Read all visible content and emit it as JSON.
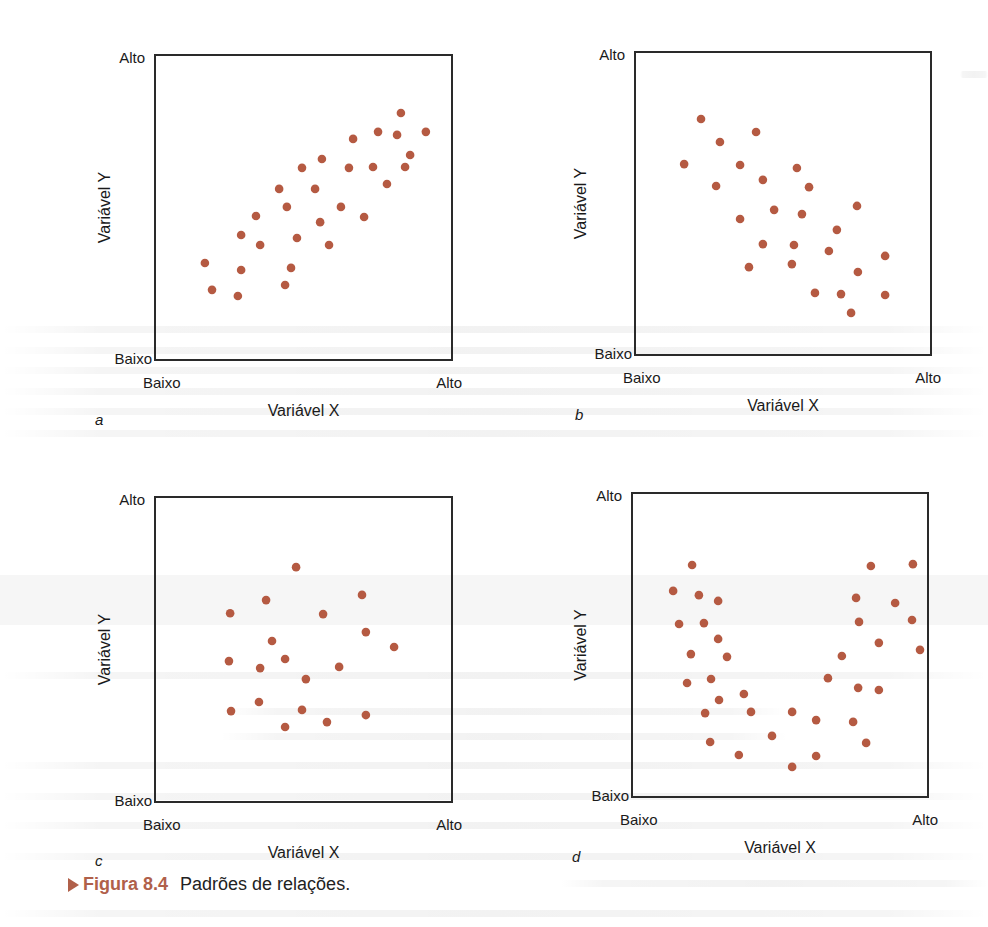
{
  "figure": {
    "caption_label": "Figura 8.4",
    "caption_text": "Padrões de relações.",
    "dot_color": "#b55a42",
    "caption_color": "#b0604a"
  },
  "chart_data": [
    {
      "type": "scatter",
      "panel": "a",
      "title": "",
      "xlabel": "Variável X",
      "ylabel": "Variável Y",
      "x_ticks": [
        "Baixo",
        "Alto"
      ],
      "y_ticks": [
        "Baixo",
        "Alto"
      ],
      "xlim": [
        0,
        100
      ],
      "ylim": [
        0,
        100
      ],
      "grid": false,
      "relationship": "positive linear",
      "points": [
        [
          16.8,
          31.8
        ],
        [
          19.2,
          23.0
        ],
        [
          29.0,
          41.0
        ],
        [
          29.0,
          29.5
        ],
        [
          27.9,
          21.0
        ],
        [
          34.0,
          47.2
        ],
        [
          35.4,
          37.7
        ],
        [
          41.8,
          56.1
        ],
        [
          44.4,
          50.2
        ],
        [
          45.8,
          30.2
        ],
        [
          43.8,
          24.6
        ],
        [
          47.8,
          40.0
        ],
        [
          49.5,
          63.0
        ],
        [
          53.9,
          56.1
        ],
        [
          55.6,
          45.2
        ],
        [
          56.2,
          65.9
        ],
        [
          58.6,
          37.7
        ],
        [
          62.6,
          50.2
        ],
        [
          65.3,
          63.0
        ],
        [
          66.7,
          72.5
        ],
        [
          70.4,
          46.9
        ],
        [
          73.4,
          63.3
        ],
        [
          75.1,
          74.8
        ],
        [
          78.1,
          57.7
        ],
        [
          81.5,
          73.8
        ],
        [
          82.8,
          81.0
        ],
        [
          84.2,
          63.3
        ],
        [
          85.9,
          67.2
        ],
        [
          91.2,
          74.8
        ]
      ]
    },
    {
      "type": "scatter",
      "panel": "b",
      "title": "",
      "xlabel": "Variável X",
      "ylabel": "Variável Y",
      "x_ticks": [
        "Baixo",
        "Alto"
      ],
      "y_ticks": [
        "Baixo",
        "Alto"
      ],
      "xlim": [
        0,
        100
      ],
      "ylim": [
        0,
        100
      ],
      "grid": false,
      "relationship": "negative linear",
      "points": [
        [
          22.3,
          77.9
        ],
        [
          40.9,
          73.6
        ],
        [
          28.7,
          70.3
        ],
        [
          16.6,
          63.0
        ],
        [
          35.5,
          62.7
        ],
        [
          54.7,
          61.7
        ],
        [
          43.2,
          57.8
        ],
        [
          27.4,
          55.8
        ],
        [
          58.8,
          55.4
        ],
        [
          47.0,
          47.9
        ],
        [
          56.4,
          46.5
        ],
        [
          75.0,
          49.2
        ],
        [
          35.5,
          44.9
        ],
        [
          68.2,
          41.3
        ],
        [
          43.2,
          36.6
        ],
        [
          53.7,
          36.3
        ],
        [
          65.5,
          34.3
        ],
        [
          84.5,
          32.7
        ],
        [
          38.5,
          29.0
        ],
        [
          53.0,
          30.0
        ],
        [
          75.3,
          27.4
        ],
        [
          60.8,
          20.5
        ],
        [
          69.6,
          20.1
        ],
        [
          84.5,
          19.8
        ],
        [
          73.0,
          13.9
        ]
      ]
    },
    {
      "type": "scatter",
      "panel": "c",
      "title": "",
      "xlabel": "Variável X",
      "ylabel": "Variável Y",
      "x_ticks": [
        "Baixo",
        "Alto"
      ],
      "y_ticks": [
        "Baixo",
        "Alto"
      ],
      "xlim": [
        0,
        100
      ],
      "ylim": [
        0,
        100
      ],
      "grid": false,
      "relationship": "no relationship",
      "points": [
        [
          47.5,
          77.0
        ],
        [
          69.7,
          67.9
        ],
        [
          37.4,
          66.2
        ],
        [
          25.3,
          61.9
        ],
        [
          56.6,
          61.6
        ],
        [
          71.0,
          55.7
        ],
        [
          39.4,
          52.8
        ],
        [
          80.5,
          50.8
        ],
        [
          24.9,
          46.2
        ],
        [
          43.8,
          46.9
        ],
        [
          35.4,
          43.9
        ],
        [
          62.0,
          44.3
        ],
        [
          50.8,
          40.3
        ],
        [
          35.0,
          32.8
        ],
        [
          25.6,
          29.8
        ],
        [
          49.5,
          30.2
        ],
        [
          71.0,
          28.5
        ],
        [
          57.9,
          26.2
        ],
        [
          43.8,
          24.6
        ]
      ]
    },
    {
      "type": "scatter",
      "panel": "d",
      "title": "",
      "xlabel": "Variável X",
      "ylabel": "Variável Y",
      "x_ticks": [
        "Baixo",
        "Alto"
      ],
      "y_ticks": [
        "Baixo",
        "Alto"
      ],
      "xlim": [
        0,
        100
      ],
      "ylim": [
        0,
        100
      ],
      "grid": false,
      "relationship": "curvilinear (U-shaped)",
      "points": [
        [
          20.3,
          76.3
        ],
        [
          80.7,
          76.0
        ],
        [
          94.9,
          76.6
        ],
        [
          13.9,
          67.8
        ],
        [
          22.6,
          66.4
        ],
        [
          29.1,
          64.5
        ],
        [
          75.7,
          65.5
        ],
        [
          88.9,
          63.8
        ],
        [
          15.9,
          56.9
        ],
        [
          24.3,
          57.2
        ],
        [
          76.7,
          57.6
        ],
        [
          94.6,
          58.2
        ],
        [
          29.1,
          52.0
        ],
        [
          83.4,
          50.7
        ],
        [
          19.9,
          47.0
        ],
        [
          32.1,
          46.1
        ],
        [
          70.9,
          46.4
        ],
        [
          97.3,
          48.4
        ],
        [
          18.6,
          37.5
        ],
        [
          26.7,
          38.8
        ],
        [
          66.2,
          39.1
        ],
        [
          76.4,
          35.9
        ],
        [
          83.4,
          35.2
        ],
        [
          29.4,
          31.9
        ],
        [
          37.8,
          33.9
        ],
        [
          24.7,
          27.6
        ],
        [
          40.2,
          28.0
        ],
        [
          54.1,
          28.0
        ],
        [
          62.2,
          25.3
        ],
        [
          74.7,
          24.7
        ],
        [
          26.4,
          18.1
        ],
        [
          47.3,
          20.1
        ],
        [
          79.1,
          17.8
        ],
        [
          36.1,
          13.8
        ],
        [
          62.2,
          13.5
        ],
        [
          54.1,
          9.9
        ]
      ]
    }
  ]
}
